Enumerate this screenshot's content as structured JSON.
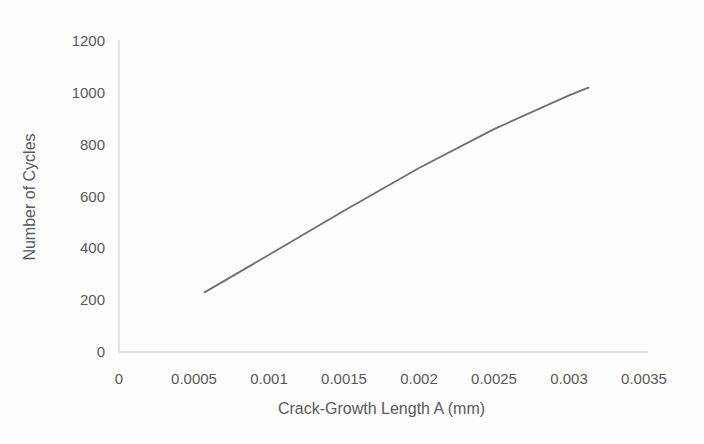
{
  "chart_data": {
    "type": "line",
    "title": "",
    "xlabel": "Crack-Growth Length A (mm)",
    "ylabel": "Number of Cycles",
    "xlim": [
      0,
      0.0035
    ],
    "ylim": [
      0,
      1200
    ],
    "grid": false,
    "legend_position": "none",
    "xticks": {
      "values": [
        0,
        0.0005,
        0.001,
        0.0015,
        0.002,
        0.0025,
        0.003,
        0.0035
      ],
      "labels": [
        "0",
        "0.0005",
        "0.001",
        "0.0015",
        "0.002",
        "0.0025",
        "0.003",
        "0.0035"
      ]
    },
    "yticks": {
      "values": [
        0,
        200,
        400,
        600,
        800,
        1000,
        1200
      ],
      "labels": [
        "0",
        "200",
        "400",
        "600",
        "800",
        "1000",
        "1200"
      ]
    },
    "series": [
      {
        "name": "number-of-cycles-vs-crack-growth-length",
        "color": "#6f6f6f",
        "points": [
          {
            "x": 0.00057,
            "y": 230
          },
          {
            "x": 0.001,
            "y": 375
          },
          {
            "x": 0.0015,
            "y": 545
          },
          {
            "x": 0.002,
            "y": 710
          },
          {
            "x": 0.0025,
            "y": 860
          },
          {
            "x": 0.003,
            "y": 990
          },
          {
            "x": 0.00313,
            "y": 1020
          }
        ]
      }
    ]
  },
  "style": {
    "background": "#fdfdfc",
    "axis_line_color": "#c8c8c5",
    "tick_label_color": "#595959",
    "axis_title_color": "#595959"
  }
}
